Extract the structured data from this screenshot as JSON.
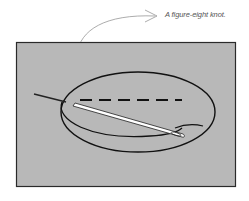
{
  "caption": {
    "text": "A figure-eight knot."
  },
  "illustration": {
    "subject": "needle threaded through fabric forming a figure-eight knot",
    "background_color": "#b8b8b8",
    "border_color": "#2a2a2a",
    "thread_color": "#111111",
    "needle_color": "#ffffff"
  }
}
